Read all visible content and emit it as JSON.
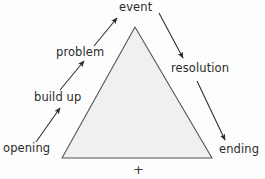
{
  "diagram": {
    "shape": {
      "name": "triangle",
      "fill_color": "#f0f0f0",
      "stroke_color": "#555555",
      "apex": [
        135,
        27
      ],
      "base_left": [
        62,
        158
      ],
      "base_right": [
        212,
        158
      ]
    },
    "background_color": "#fdfdfd",
    "text_color": "#2b2b2b",
    "arrow_color": "#2b2b2b",
    "stages": [
      {
        "id": "opening",
        "label": "opening",
        "arrow_direction": "up-right"
      },
      {
        "id": "build-up",
        "label": "build up",
        "arrow_direction": "up-right"
      },
      {
        "id": "problem",
        "label": "problem",
        "arrow_direction": "up-right"
      },
      {
        "id": "event",
        "label": "event",
        "arrow_direction": "none"
      },
      {
        "id": "resolution",
        "label": "resolution",
        "arrow_direction": "down-right"
      },
      {
        "id": "ending",
        "label": "ending",
        "arrow_direction": "down-right"
      }
    ],
    "marks": {
      "plus": "+"
    }
  }
}
